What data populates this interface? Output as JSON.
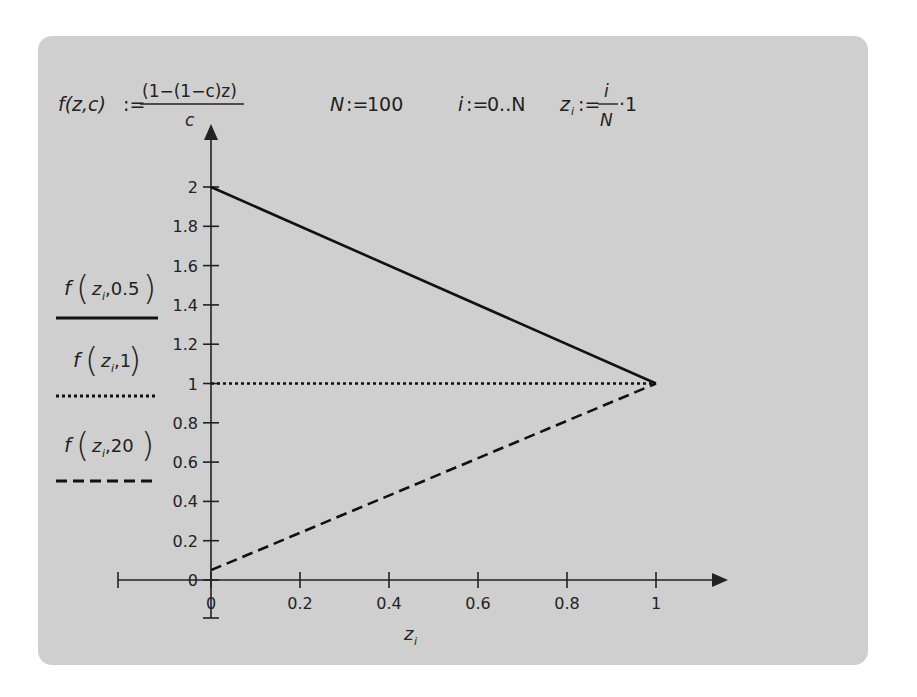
{
  "worksheet": {
    "definitions": {
      "function": {
        "lhs": "f(z,c)",
        "assign": ":=",
        "numerator": "(1−(1−c)z)",
        "denominator": "c"
      },
      "n_def": {
        "lhs": "N",
        "assign": ":=",
        "rhs": "100"
      },
      "i_def": {
        "lhs": "i",
        "assign": ":=",
        "rhs": "0..N"
      },
      "z_def": {
        "lhs": "z",
        "subscript": "i",
        "assign": ":=",
        "numerator": "i",
        "denominator": "N",
        "factor": "·1"
      }
    },
    "legend": [
      {
        "label_fn": "f",
        "arg_var": "z",
        "arg_sub": "i",
        "arg_param": ",0.5",
        "style": "solid"
      },
      {
        "label_fn": "f",
        "arg_var": "z",
        "arg_sub": "i",
        "arg_param": ",1",
        "style": "dotted"
      },
      {
        "label_fn": "f",
        "arg_var": "z",
        "arg_sub": "i",
        "arg_param": ",20",
        "style": "dashed"
      }
    ],
    "x_axis_label": {
      "var": "z",
      "sub": "i"
    }
  },
  "chart_data": {
    "type": "line",
    "title": "",
    "xlabel": "z_i",
    "ylabel": "",
    "xlim": [
      0,
      1
    ],
    "ylim": [
      0,
      2
    ],
    "grid": false,
    "legend_position": "left",
    "x_ticks": [
      "0",
      "0.2",
      "0.4",
      "0.6",
      "0.8",
      "1"
    ],
    "y_ticks": [
      "0",
      "0.2",
      "0.4",
      "0.6",
      "0.8",
      "1",
      "1.2",
      "1.4",
      "1.6",
      "1.8",
      "2"
    ],
    "x": [
      0,
      1
    ],
    "series": [
      {
        "name": "f(z_i,0.5)",
        "style": "solid",
        "values": [
          2.0,
          1.0
        ]
      },
      {
        "name": "f(z_i,1)",
        "style": "dotted",
        "values": [
          1.0,
          1.0
        ]
      },
      {
        "name": "f(z_i,20)",
        "style": "dashed",
        "values": [
          0.05,
          1.0
        ]
      }
    ]
  }
}
